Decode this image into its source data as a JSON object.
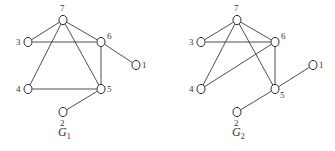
{
  "graphs": [
    {
      "name": "G",
      "subscript": "1",
      "label_pos": [
        58,
        136
      ],
      "nodes": [
        {
          "id": "7",
          "x": 63,
          "y": 20,
          "lx": 60,
          "ly": 11
        },
        {
          "id": "3",
          "x": 28,
          "y": 42,
          "lx": 16,
          "ly": 45
        },
        {
          "id": "6",
          "x": 101,
          "y": 42,
          "lx": 107,
          "ly": 39
        },
        {
          "id": "1",
          "x": 136,
          "y": 65,
          "lx": 142,
          "ly": 68
        },
        {
          "id": "4",
          "x": 28,
          "y": 89,
          "lx": 16,
          "ly": 92
        },
        {
          "id": "5",
          "x": 101,
          "y": 89,
          "lx": 107,
          "ly": 92
        },
        {
          "id": "2",
          "x": 63,
          "y": 112,
          "lx": 60,
          "ly": 126
        }
      ],
      "edges": [
        [
          "7",
          "3"
        ],
        [
          "7",
          "6"
        ],
        [
          "7",
          "4"
        ],
        [
          "7",
          "5"
        ],
        [
          "3",
          "6"
        ],
        [
          "6",
          "5"
        ],
        [
          "6",
          "1"
        ],
        [
          "4",
          "5"
        ],
        [
          "5",
          "2"
        ]
      ]
    },
    {
      "name": "G",
      "subscript": "2",
      "label_pos": [
        232,
        136
      ],
      "nodes": [
        {
          "id": "7",
          "x": 237,
          "y": 20,
          "lx": 234,
          "ly": 11
        },
        {
          "id": "3",
          "x": 201,
          "y": 42,
          "lx": 189,
          "ly": 45
        },
        {
          "id": "6",
          "x": 275,
          "y": 42,
          "lx": 281,
          "ly": 39
        },
        {
          "id": "1",
          "x": 313,
          "y": 65,
          "lx": 319,
          "ly": 68
        },
        {
          "id": "4",
          "x": 201,
          "y": 89,
          "lx": 189,
          "ly": 92
        },
        {
          "id": "5",
          "x": 275,
          "y": 89,
          "lx": 280,
          "ly": 98
        },
        {
          "id": "2",
          "x": 237,
          "y": 112,
          "lx": 234,
          "ly": 126
        }
      ],
      "edges": [
        [
          "7",
          "3"
        ],
        [
          "7",
          "6"
        ],
        [
          "7",
          "4"
        ],
        [
          "7",
          "5"
        ],
        [
          "3",
          "6"
        ],
        [
          "6",
          "5"
        ],
        [
          "6",
          "4"
        ],
        [
          "5",
          "1"
        ],
        [
          "5",
          "2"
        ]
      ]
    }
  ]
}
